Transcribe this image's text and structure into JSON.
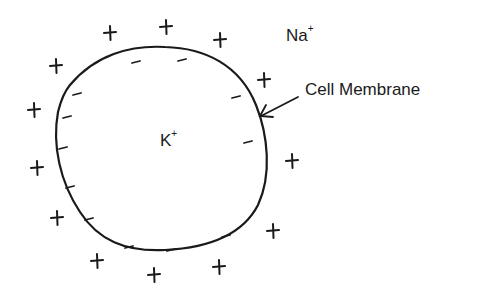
{
  "diagram": {
    "labels": {
      "outside_ion": "Na",
      "outside_ion_charge": "+",
      "inside_ion": "K",
      "inside_ion_charge": "+",
      "membrane": "Cell Membrane"
    },
    "colors": {
      "ink": "#1a1a1a",
      "background": "#ffffff"
    },
    "outside_charges": {
      "symbol": "+",
      "count": 13,
      "positions": [
        [
          110,
          33
        ],
        [
          166,
          27
        ],
        [
          220,
          40
        ],
        [
          56,
          66
        ],
        [
          34,
          110
        ],
        [
          264,
          80
        ],
        [
          292,
          161
        ],
        [
          37,
          168
        ],
        [
          57,
          218
        ],
        [
          273,
          231
        ],
        [
          97,
          261
        ],
        [
          154,
          275
        ],
        [
          219,
          267
        ]
      ]
    },
    "inside_charges": {
      "symbol": "-",
      "count": 12,
      "positions": [
        [
          136,
          62
        ],
        [
          182,
          60
        ],
        [
          77,
          94
        ],
        [
          67,
          117
        ],
        [
          236,
          97
        ],
        [
          63,
          148
        ],
        [
          248,
          142
        ],
        [
          70,
          187
        ],
        [
          89,
          219
        ],
        [
          129,
          247
        ],
        [
          171,
          250
        ],
        [
          226,
          236
        ]
      ]
    }
  }
}
